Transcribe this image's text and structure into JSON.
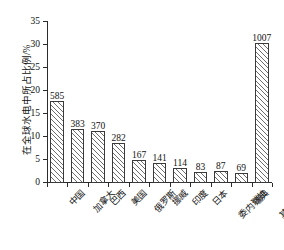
{
  "chart_data": {
    "type": "bar",
    "title": "",
    "xlabel": "",
    "ylabel": "在全球水电中所占比例/%",
    "ylim": [
      0,
      35
    ],
    "yticks": [
      0,
      5,
      10,
      15,
      20,
      25,
      30,
      35
    ],
    "grid": false,
    "legend": null,
    "categories": [
      "中国",
      "加拿大",
      "巴西",
      "美国",
      "俄罗斯",
      "挪威",
      "印度",
      "日本",
      "委内瑞拉",
      "瑞典",
      "其他国家"
    ],
    "values": [
      17.9,
      11.7,
      11.3,
      8.6,
      5.1,
      4.3,
      3.3,
      2.5,
      2.6,
      2.1,
      30.5
    ],
    "point_labels": [
      "585",
      "383",
      "370",
      "282",
      "167",
      "141",
      "114",
      "83",
      "87",
      "69",
      "1007"
    ],
    "bar_style": {
      "fill": "#ffffff",
      "edge": "#3a3a3a",
      "hatch": "diagonal-lines"
    }
  },
  "axis": {
    "y_tick_labels": [
      "0",
      "5",
      "10",
      "15",
      "20",
      "25",
      "30",
      "35"
    ]
  }
}
